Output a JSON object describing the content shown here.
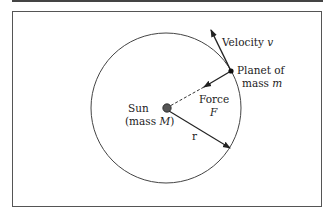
{
  "diagram": {
    "labels": {
      "velocity": "Velocity ",
      "velocity_symbol": "v",
      "planet_line1": "Planet of",
      "planet_line2": "mass ",
      "planet_symbol": "m",
      "force_line1": "Force",
      "force_symbol": "F",
      "sun_line1": "Sun",
      "sun_line2_pre": "(mass ",
      "sun_symbol": "M",
      "sun_line2_post": ")",
      "radius": "r"
    },
    "colors": {
      "line": "#333333",
      "sun_fill": "#555555",
      "frame": "#555555",
      "background": "#ffffff"
    }
  }
}
